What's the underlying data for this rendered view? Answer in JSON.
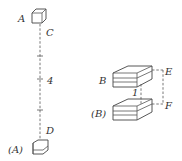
{
  "diagram": {
    "left_figure": {
      "top_cube_label": "A",
      "top_point_label": "C",
      "middle_label": "4",
      "bottom_point_label": "D",
      "bottom_cube_label": "(A)"
    },
    "right_figure": {
      "top_prism_label": "B",
      "bottom_prism_label": "(B)",
      "gap_label": "1",
      "right_top_label": "E",
      "right_bottom_label": "F"
    },
    "colors": {
      "stroke": "#444444",
      "text": "#333333",
      "background": "#ffffff"
    }
  }
}
